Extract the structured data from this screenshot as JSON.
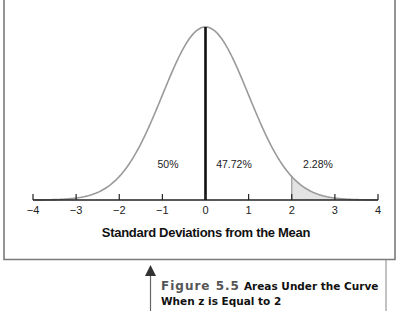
{
  "chart_data": {
    "type": "area",
    "title": "Areas Under the Curve When z is Equal to 2",
    "figure_label": "Figure 5.5",
    "xlabel": "Standard Deviations from the Mean",
    "ylabel": "",
    "xlim": [
      -4,
      4
    ],
    "x_ticks": [
      -4,
      -3,
      -2,
      -1,
      0,
      1,
      2,
      3,
      4
    ],
    "x_tick_labels": [
      "−4",
      "−3",
      "−2",
      "−1",
      "0",
      "1",
      "2",
      "3",
      "4"
    ],
    "grid": false,
    "legend": null,
    "curve": "standard normal distribution",
    "reference_lines": [
      {
        "x": 0,
        "label": "mean",
        "style": "bold black"
      },
      {
        "x": 2,
        "label": "z = 2",
        "style": "thin gray"
      }
    ],
    "shaded_region": {
      "from": 2,
      "to": 4,
      "color": "#e3e3e3"
    },
    "annotations": [
      {
        "text": "50%",
        "region": "z < 0"
      },
      {
        "text": "47.72%",
        "region": "0 < z < 2"
      },
      {
        "text": "2.28%",
        "region": "z > 2"
      }
    ],
    "areas": [
      {
        "range": [
          -4,
          0
        ],
        "percent": 50
      },
      {
        "range": [
          0,
          2
        ],
        "percent": 47.72
      },
      {
        "range": [
          2,
          4
        ],
        "percent": 2.28
      }
    ]
  },
  "caption": {
    "figure_number": "Figure 5.5",
    "line1": "Areas Under the Curve",
    "line2": "When z is Equal to 2"
  },
  "colors": {
    "curve": "#9a9a9a",
    "axis": "#222222",
    "mean_line": "#111111",
    "shade": "#e3e3e3",
    "frame": "#7a7a7a"
  }
}
